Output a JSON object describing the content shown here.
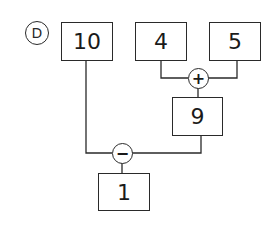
{
  "diagram": {
    "label": "D",
    "nodes": {
      "n10": "10",
      "n4": "4",
      "n5": "5",
      "n9": "9",
      "n1": "1"
    },
    "operators": {
      "plus": "+",
      "minus": "−"
    },
    "edges": [
      {
        "from": "4",
        "to": "+"
      },
      {
        "from": "5",
        "to": "+"
      },
      {
        "from": "+",
        "to": "9"
      },
      {
        "from": "10",
        "to": "−"
      },
      {
        "from": "9",
        "to": "−"
      },
      {
        "from": "−",
        "to": "1"
      }
    ],
    "colors": {
      "stroke": "#2a2a2a",
      "background": "#ffffff"
    }
  }
}
